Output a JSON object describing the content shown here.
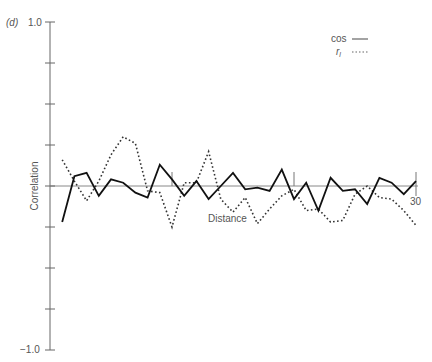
{
  "panel_label": "(d)",
  "chart_data": {
    "type": "line",
    "title": "",
    "xlabel": "Distance",
    "ylabel": "Correlation",
    "xlim": [
      0,
      30
    ],
    "ylim": [
      -1.0,
      1.0
    ],
    "y_tick_labels": {
      "top": "1.0",
      "bottom": "−1.0"
    },
    "x_tick_labels": {
      "end": "30"
    },
    "x_ticks": [
      10,
      20,
      30
    ],
    "y_ticks": [
      -1.0,
      -0.75,
      -0.5,
      -0.25,
      0,
      0.25,
      0.5,
      0.75,
      1.0
    ],
    "grid": false,
    "legend_position": "top-right",
    "x": [
      1,
      2,
      3,
      4,
      5,
      6,
      7,
      8,
      9,
      10,
      11,
      12,
      13,
      14,
      15,
      16,
      17,
      18,
      19,
      20,
      21,
      22,
      23,
      24,
      25,
      26,
      27,
      28,
      29,
      30
    ],
    "series": [
      {
        "name": "cos",
        "style": "solid",
        "values": [
          -0.22,
          0.06,
          0.08,
          -0.06,
          0.04,
          0.02,
          -0.04,
          -0.07,
          0.13,
          0.04,
          -0.06,
          0.03,
          -0.08,
          0.0,
          0.08,
          -0.02,
          -0.01,
          -0.03,
          0.1,
          -0.08,
          0.02,
          -0.15,
          0.05,
          -0.03,
          -0.02,
          -0.11,
          0.05,
          0.02,
          -0.05,
          0.03
        ]
      },
      {
        "name": "r_l",
        "style": "dotted",
        "values": [
          0.16,
          0.03,
          -0.09,
          0.03,
          0.19,
          0.3,
          0.26,
          -0.03,
          -0.04,
          -0.25,
          0.02,
          0.02,
          0.21,
          -0.08,
          -0.16,
          -0.07,
          -0.23,
          -0.14,
          -0.06,
          -0.02,
          -0.15,
          -0.14,
          -0.22,
          -0.21,
          -0.05,
          0.0,
          -0.07,
          -0.08,
          -0.15,
          -0.24
        ]
      }
    ]
  },
  "legend": {
    "items": [
      {
        "label": "cos",
        "style": "solid"
      },
      {
        "label": "r",
        "subscript": "l",
        "style": "dotted"
      }
    ]
  }
}
